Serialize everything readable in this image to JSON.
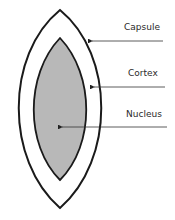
{
  "diagram": {
    "type": "lens-cross-section",
    "labels": {
      "capsule": "Capsule",
      "cortex": "Cortex",
      "nucleus": "Nucleus"
    },
    "colors": {
      "outline": "#1a1a1a",
      "nucleus_fill": "#b8b8b8",
      "cortex_fill": "#ffffff",
      "leader_line": "#333333"
    }
  }
}
